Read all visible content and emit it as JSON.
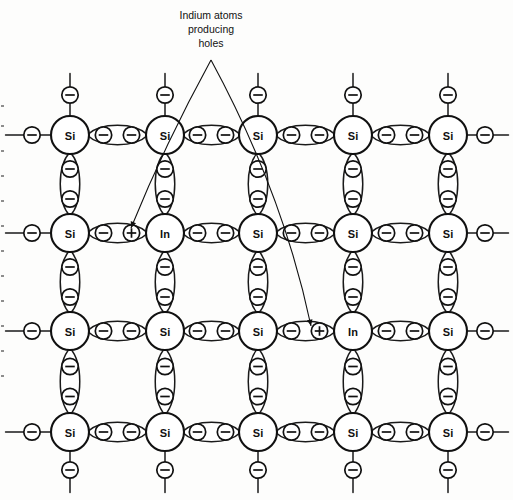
{
  "figure": {
    "kind": "crystal-lattice-diagram",
    "background_color": "#fdfdfc",
    "ink_color": "#111111"
  },
  "annotation": {
    "lines": [
      "Indium atoms",
      "producing",
      "holes"
    ],
    "line1": "Indium atoms",
    "line2": "producing",
    "line3": "holes",
    "anchor": {
      "x": 211,
      "y": 60
    },
    "arrow_targets": [
      {
        "x": 131,
        "y": 228,
        "label": "hole-1"
      },
      {
        "x": 311,
        "y": 326,
        "label": "hole-2"
      }
    ]
  },
  "lattice": {
    "columns_x": [
      70,
      165,
      258,
      353,
      448
    ],
    "rows_y": [
      135,
      233,
      331,
      432
    ],
    "atom_radius": 19,
    "particle_radius": 8.2,
    "atoms": [
      [
        {
          "symbol": "Si",
          "name": "silicon"
        },
        {
          "symbol": "Si",
          "name": "silicon"
        },
        {
          "symbol": "Si",
          "name": "silicon"
        },
        {
          "symbol": "Si",
          "name": "silicon"
        },
        {
          "symbol": "Si",
          "name": "silicon"
        }
      ],
      [
        {
          "symbol": "Si",
          "name": "silicon"
        },
        {
          "symbol": "In",
          "name": "indium"
        },
        {
          "symbol": "Si",
          "name": "silicon"
        },
        {
          "symbol": "Si",
          "name": "silicon"
        },
        {
          "symbol": "Si",
          "name": "silicon"
        }
      ],
      [
        {
          "symbol": "Si",
          "name": "silicon"
        },
        {
          "symbol": "Si",
          "name": "silicon"
        },
        {
          "symbol": "Si",
          "name": "silicon"
        },
        {
          "symbol": "In",
          "name": "indium"
        },
        {
          "symbol": "Si",
          "name": "silicon"
        }
      ],
      [
        {
          "symbol": "Si",
          "name": "silicon"
        },
        {
          "symbol": "Si",
          "name": "silicon"
        },
        {
          "symbol": "Si",
          "name": "silicon"
        },
        {
          "symbol": "Si",
          "name": "silicon"
        },
        {
          "symbol": "Si",
          "name": "silicon"
        }
      ]
    ],
    "horizontal_bonds": [
      {
        "row": 0,
        "col": 0,
        "particles": [
          "electron",
          "electron"
        ]
      },
      {
        "row": 0,
        "col": 1,
        "particles": [
          "electron",
          "electron"
        ]
      },
      {
        "row": 0,
        "col": 2,
        "particles": [
          "electron",
          "electron"
        ]
      },
      {
        "row": 0,
        "col": 3,
        "particles": [
          "electron",
          "electron"
        ]
      },
      {
        "row": 1,
        "col": 0,
        "particles": [
          "electron",
          "hole"
        ]
      },
      {
        "row": 1,
        "col": 1,
        "particles": [
          "electron",
          "electron"
        ]
      },
      {
        "row": 1,
        "col": 2,
        "particles": [
          "electron",
          "electron"
        ]
      },
      {
        "row": 1,
        "col": 3,
        "particles": [
          "electron",
          "electron"
        ]
      },
      {
        "row": 2,
        "col": 0,
        "particles": [
          "electron",
          "electron"
        ]
      },
      {
        "row": 2,
        "col": 1,
        "particles": [
          "electron",
          "electron"
        ]
      },
      {
        "row": 2,
        "col": 2,
        "particles": [
          "electron",
          "hole"
        ]
      },
      {
        "row": 2,
        "col": 3,
        "particles": [
          "electron",
          "electron"
        ]
      },
      {
        "row": 3,
        "col": 0,
        "particles": [
          "electron",
          "electron"
        ]
      },
      {
        "row": 3,
        "col": 1,
        "particles": [
          "electron",
          "electron"
        ]
      },
      {
        "row": 3,
        "col": 2,
        "particles": [
          "electron",
          "electron"
        ]
      },
      {
        "row": 3,
        "col": 3,
        "particles": [
          "electron",
          "electron"
        ]
      }
    ],
    "vertical_bonds_particles": [
      "electron",
      "electron"
    ],
    "edge_stubs": {
      "left_x": 32,
      "right_x": 485,
      "top_y": 95,
      "bottom_y": 470,
      "particle": "electron"
    },
    "symbols": {
      "electron": "minus-in-circle",
      "hole": "plus-in-circle"
    },
    "counts": {
      "silicon_atoms": 18,
      "indium_atoms": 2,
      "holes": 2
    }
  }
}
